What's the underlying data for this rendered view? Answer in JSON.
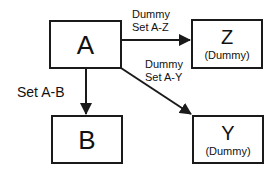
{
  "diagram": {
    "nodes": {
      "a": {
        "title": "A"
      },
      "b": {
        "title": "B"
      },
      "z": {
        "title": "Z",
        "subtitle": "(Dummy)"
      },
      "y": {
        "title": "Y",
        "subtitle": "(Dummy)"
      }
    },
    "edges": {
      "a_b": {
        "label": "Set A-B"
      },
      "a_z": {
        "line1": "Dummy",
        "line2": "Set A-Z"
      },
      "a_y": {
        "line1": "Dummy",
        "line2": "Set A-Y"
      }
    },
    "colors": {
      "stroke": "#1a1a1a",
      "background": "#ffffff",
      "text": "#111111"
    }
  }
}
